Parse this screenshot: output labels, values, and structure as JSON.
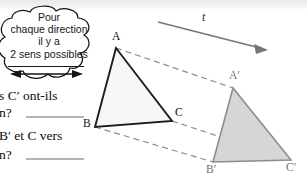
{
  "figure": {
    "kind": "geometry-translation-diagram",
    "background_color": "#ffffff",
    "top_band_color": "#ededed",
    "thought_bubble": {
      "lines": [
        "Pour",
        "chaque direction",
        "il y a",
        "2 sens possibles"
      ],
      "outline_color": "#1a1a1a",
      "fill_color": "#ffffff",
      "has_double_arrow": true,
      "double_arrow_direction": "left-right"
    },
    "questions": [
      {
        "line1": "s C′ ont-ils",
        "line2": "n?",
        "has_answer_rule": true
      },
      {
        "line1": "B′ et C vers",
        "line2": "n?",
        "has_answer_rule": true
      }
    ],
    "vector": {
      "label": "t",
      "label_style": "italic",
      "color": "#6a6a6e",
      "from": [
        158,
        22
      ],
      "to": [
        266,
        50
      ]
    },
    "triangle_source": {
      "name": "ABC",
      "fill_color": "#f7f7f7",
      "stroke_color": "#1d1d20",
      "vertices": [
        {
          "label": "A",
          "x": 116,
          "y": 48
        },
        {
          "label": "B",
          "x": 95,
          "y": 127
        },
        {
          "label": "C",
          "x": 172,
          "y": 121
        }
      ]
    },
    "triangle_image": {
      "name": "A′B′C′",
      "fill_color": "#d6d6d6",
      "stroke_color": "#8d8d91",
      "vertices": [
        {
          "label": "A′",
          "x": 233,
          "y": 88
        },
        {
          "label": "B′",
          "x": 213,
          "y": 162
        },
        {
          "label": "C′",
          "x": 291,
          "y": 160
        }
      ]
    },
    "correspondence_lines": [
      {
        "name": "A-to-Aprime",
        "from": [
          116,
          48
        ],
        "to": [
          233,
          88
        ],
        "style": "dashed",
        "color": "#8e8e92"
      },
      {
        "name": "B-to-Bprime",
        "from": [
          95,
          127
        ],
        "to": [
          213,
          162
        ],
        "style": "dashed",
        "color": "#8e8e92"
      },
      {
        "name": "C-to-Cprime",
        "from": [
          172,
          121
        ],
        "to": [
          291,
          160
        ],
        "style": "dashed",
        "color": "#8e8e92"
      }
    ]
  }
}
